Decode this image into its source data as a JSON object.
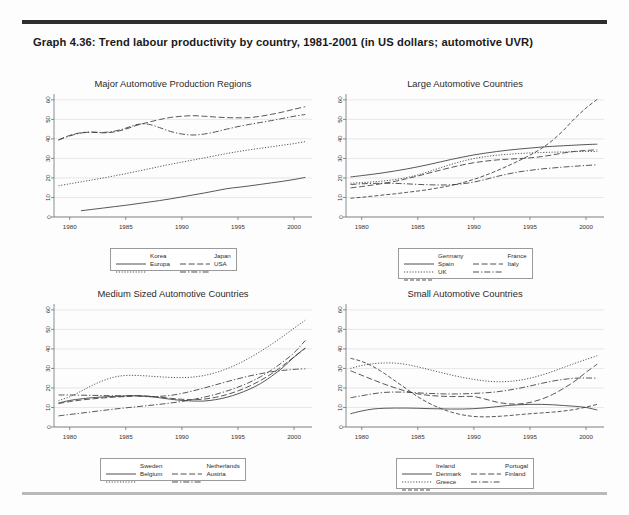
{
  "caption": "Graph 4.36: Trend labour productivity by country, 1981-2001 (in US dollars; automotive UVR)",
  "colors": {
    "line": "#3a3a3a",
    "grid": "#d8d8d8",
    "axis": "#6f6f6f",
    "rule_top": "#2e2e2e",
    "rule_bottom": "#b9b9b9",
    "background": "#fdfdfd"
  },
  "axes": {
    "xticks": [
      "1980",
      "1985",
      "1990",
      "1995",
      "2000"
    ],
    "xtick_values": [
      1980,
      1985,
      1990,
      1995,
      2000
    ],
    "yticks": [
      "0",
      "10",
      "20",
      "30",
      "40",
      "50",
      "60"
    ],
    "ytick_values": [
      0,
      10,
      20,
      30,
      40,
      50,
      60
    ],
    "xlim": [
      1978.6,
      2001.6
    ],
    "ylim": [
      0,
      63
    ],
    "xlabel": "",
    "ylabel": ""
  },
  "chart_data": [
    {
      "id": "major-regions",
      "type": "line",
      "title": "Major Automotive Production Regions",
      "xlabel": "",
      "ylabel": "",
      "xlim": [
        1978.6,
        2001.6
      ],
      "ylim": [
        0,
        63
      ],
      "grid": true,
      "legend_position": "below",
      "x": [
        1979,
        1980,
        1981,
        1982,
        1983,
        1984,
        1985,
        1986,
        1987,
        1988,
        1989,
        1990,
        1991,
        1992,
        1993,
        1994,
        1995,
        1996,
        1997,
        1998,
        1999,
        2000,
        2001
      ],
      "series": [
        {
          "name": "Korea",
          "dash": "solid",
          "values": [
            null,
            null,
            3.2,
            3.9,
            4.6,
            5.3,
            6.0,
            6.8,
            7.6,
            8.4,
            9.3,
            10.3,
            11.3,
            12.3,
            13.4,
            14.5,
            15.2,
            15.9,
            16.7,
            17.5,
            18.3,
            19.2,
            20.3
          ]
        },
        {
          "name": "Japan",
          "dash": "dash",
          "values": [
            39.5,
            41.8,
            43.2,
            43.4,
            43.1,
            43.6,
            45.0,
            47.0,
            48.5,
            49.9,
            51.0,
            51.6,
            51.9,
            51.6,
            51.2,
            50.9,
            50.8,
            50.9,
            51.6,
            52.6,
            53.8,
            55.2,
            56.5
          ]
        },
        {
          "name": "Europa",
          "dash": "dot",
          "values": [
            16.0,
            17.0,
            18.0,
            19.0,
            20.0,
            21.1,
            22.2,
            23.4,
            24.6,
            25.8,
            27.0,
            28.1,
            29.2,
            30.3,
            31.4,
            32.5,
            33.5,
            34.4,
            35.2,
            36.0,
            36.8,
            37.6,
            38.6
          ]
        },
        {
          "name": "USA",
          "dash": "dashdot",
          "values": [
            39.4,
            41.5,
            43.0,
            43.5,
            43.3,
            44.0,
            45.5,
            47.4,
            47.5,
            45.8,
            43.8,
            42.5,
            42.0,
            42.5,
            43.6,
            45.0,
            46.3,
            47.4,
            48.4,
            49.4,
            50.5,
            51.6,
            52.5
          ]
        }
      ]
    },
    {
      "id": "large-countries",
      "type": "line",
      "title": "Large Automotive Countries",
      "xlabel": "",
      "ylabel": "",
      "xlim": [
        1978.6,
        2001.6
      ],
      "ylim": [
        0,
        63
      ],
      "grid": true,
      "legend_position": "below",
      "x": [
        1979,
        1980,
        1981,
        1982,
        1983,
        1984,
        1985,
        1986,
        1987,
        1988,
        1989,
        1990,
        1991,
        1992,
        1993,
        1994,
        1995,
        1996,
        1997,
        1998,
        1999,
        2000,
        2001
      ],
      "series": [
        {
          "name": "Germany",
          "dash": "solid",
          "values": [
            20.5,
            21.2,
            21.9,
            22.7,
            23.6,
            24.6,
            25.7,
            26.9,
            28.2,
            29.5,
            30.7,
            31.8,
            32.7,
            33.5,
            34.2,
            34.8,
            35.3,
            35.8,
            36.2,
            36.5,
            36.8,
            37.1,
            37.3
          ]
        },
        {
          "name": "France",
          "dash": "dash",
          "values": [
            14.9,
            15.6,
            16.4,
            17.3,
            18.3,
            19.6,
            21.0,
            22.5,
            24.0,
            25.4,
            26.7,
            27.8,
            28.6,
            29.2,
            29.6,
            29.9,
            30.3,
            30.9,
            31.8,
            32.8,
            33.6,
            34.1,
            34.4
          ]
        },
        {
          "name": "Spain",
          "dash": "dot",
          "values": [
            17.3,
            17.6,
            18.0,
            18.5,
            19.2,
            20.2,
            21.6,
            23.3,
            25.2,
            27.0,
            28.6,
            29.9,
            30.9,
            31.6,
            32.1,
            32.5,
            32.8,
            33.0,
            33.2,
            33.3,
            33.5,
            33.6,
            33.5
          ]
        },
        {
          "name": "Italy",
          "dash": "dashdot",
          "values": [
            16.6,
            17.0,
            17.2,
            17.3,
            17.2,
            17.0,
            16.7,
            16.5,
            16.4,
            16.5,
            17.0,
            17.9,
            19.2,
            20.7,
            22.0,
            23.1,
            23.9,
            24.6,
            25.1,
            25.6,
            26.0,
            26.4,
            26.7
          ]
        },
        {
          "name": "UK",
          "dash": "longdash",
          "values": [
            9.6,
            10.1,
            10.7,
            11.3,
            11.9,
            12.6,
            13.3,
            14.1,
            15.1,
            16.2,
            17.6,
            19.3,
            21.3,
            23.6,
            26.1,
            28.8,
            31.7,
            35.0,
            39.2,
            44.5,
            50.5,
            55.8,
            60.3
          ]
        }
      ]
    },
    {
      "id": "medium-countries",
      "type": "line",
      "title": "Medium Sized Automotive Countries",
      "xlabel": "",
      "ylabel": "",
      "xlim": [
        1978.6,
        2001.6
      ],
      "ylim": [
        0,
        63
      ],
      "grid": true,
      "legend_position": "below",
      "x": [
        1979,
        1980,
        1981,
        1982,
        1983,
        1984,
        1985,
        1986,
        1987,
        1988,
        1989,
        1990,
        1991,
        1992,
        1993,
        1994,
        1995,
        1996,
        1997,
        1998,
        1999,
        2000,
        2001
      ],
      "series": [
        {
          "name": "Sweden",
          "dash": "solid",
          "values": [
            12.3,
            13.6,
            14.4,
            15.0,
            15.4,
            15.7,
            15.9,
            16.0,
            15.7,
            15.0,
            14.2,
            13.6,
            13.3,
            13.3,
            14.0,
            15.2,
            17.0,
            19.3,
            22.2,
            26.0,
            30.5,
            35.8,
            40.5
          ]
        },
        {
          "name": "Netherlands",
          "dash": "dash",
          "values": [
            12.0,
            13.0,
            13.8,
            14.4,
            14.9,
            15.3,
            15.6,
            15.9,
            15.8,
            15.3,
            14.7,
            14.2,
            14.0,
            14.3,
            15.2,
            16.6,
            18.5,
            20.9,
            23.8,
            27.3,
            31.4,
            35.9,
            40.3
          ]
        },
        {
          "name": "Belgium",
          "dash": "dot",
          "values": [
            13.5,
            15.5,
            18.3,
            21.3,
            23.8,
            25.6,
            26.4,
            26.4,
            26.1,
            25.7,
            25.4,
            25.3,
            25.6,
            26.4,
            27.8,
            29.8,
            32.3,
            35.3,
            38.7,
            42.4,
            46.4,
            50.6,
            54.7
          ]
        },
        {
          "name": "Austria",
          "dash": "dashdot",
          "values": [
            16.4,
            16.4,
            16.3,
            16.2,
            16.1,
            16.0,
            16.0,
            16.0,
            15.5,
            15.7,
            16.2,
            17.2,
            18.5,
            20.0,
            21.6,
            23.2,
            24.7,
            26.1,
            27.3,
            28.3,
            29.0,
            29.5,
            29.8
          ]
        },
        {
          "name": "Austria-lower",
          "dash": "dashdot",
          "values": [
            5.7,
            6.4,
            7.1,
            7.8,
            8.5,
            9.2,
            9.8,
            10.4,
            11.0,
            11.6,
            12.3,
            13.1,
            14.1,
            15.3,
            16.7,
            18.4,
            20.4,
            22.8,
            25.7,
            29.2,
            33.3,
            38.0,
            44.3
          ]
        }
      ]
    },
    {
      "id": "small-countries",
      "type": "line",
      "title": "Small Automotive Countries",
      "xlabel": "",
      "ylabel": "",
      "xlim": [
        1978.6,
        2001.6
      ],
      "ylim": [
        0,
        63
      ],
      "grid": true,
      "legend_position": "below",
      "x": [
        1979,
        1980,
        1981,
        1982,
        1983,
        1984,
        1985,
        1986,
        1987,
        1988,
        1989,
        1990,
        1991,
        1992,
        1993,
        1994,
        1995,
        1996,
        1997,
        1998,
        1999,
        2000,
        2001
      ],
      "series": [
        {
          "name": "Ireland",
          "dash": "solid",
          "values": [
            6.8,
            8.2,
            9.2,
            9.6,
            9.7,
            9.7,
            9.6,
            9.4,
            9.3,
            9.2,
            9.2,
            9.4,
            9.8,
            10.4,
            11.0,
            11.4,
            11.6,
            11.6,
            11.4,
            11.0,
            10.6,
            10.0,
            8.7
          ]
        },
        {
          "name": "Portugal",
          "dash": "dash",
          "values": [
            28.8,
            26.5,
            24.2,
            22.0,
            20.0,
            18.3,
            17.0,
            16.2,
            15.8,
            15.6,
            15.6,
            15.6,
            14.3,
            12.8,
            11.9,
            11.8,
            12.6,
            14.2,
            16.6,
            19.8,
            23.5,
            28.0,
            32.2
          ]
        },
        {
          "name": "Denmark",
          "dash": "dot",
          "values": [
            30.0,
            31.5,
            32.4,
            32.8,
            32.7,
            32.0,
            30.8,
            29.4,
            28.0,
            26.6,
            25.4,
            24.4,
            23.6,
            23.2,
            23.3,
            23.9,
            25.0,
            26.5,
            28.4,
            30.5,
            32.6,
            34.6,
            36.5
          ]
        },
        {
          "name": "Finland",
          "dash": "dashdot",
          "values": [
            15.0,
            16.0,
            17.0,
            17.7,
            17.9,
            17.8,
            17.5,
            17.2,
            17.0,
            16.9,
            17.0,
            17.2,
            17.5,
            18.0,
            18.8,
            19.8,
            21.0,
            22.3,
            23.5,
            24.4,
            25.0,
            25.1,
            25.0
          ]
        },
        {
          "name": "Greece",
          "dash": "longdash",
          "values": [
            35.2,
            33.6,
            31.0,
            27.5,
            23.5,
            19.5,
            15.5,
            12.2,
            9.6,
            7.6,
            6.2,
            5.4,
            5.2,
            5.4,
            5.8,
            6.3,
            6.8,
            7.2,
            7.6,
            8.2,
            9.0,
            10.2,
            11.6
          ]
        }
      ]
    }
  ],
  "legends": [
    {
      "panel": "major-regions",
      "entries": [
        {
          "label": "Korea",
          "dash": "solid"
        },
        {
          "label": "Japan",
          "dash": "dash"
        },
        {
          "label": "Europa",
          "dash": "dot"
        },
        {
          "label": "USA",
          "dash": "dashdot"
        }
      ]
    },
    {
      "panel": "large-countries",
      "entries": [
        {
          "label": "Germany",
          "dash": "solid"
        },
        {
          "label": "France",
          "dash": "dash"
        },
        {
          "label": "Spain",
          "dash": "dot"
        },
        {
          "label": "Italy",
          "dash": "dashdot"
        },
        {
          "label": "UK",
          "dash": "longdash"
        }
      ]
    },
    {
      "panel": "medium-countries",
      "entries": [
        {
          "label": "Sweden",
          "dash": "solid"
        },
        {
          "label": "Netherlands",
          "dash": "dash"
        },
        {
          "label": "Belgium",
          "dash": "dot"
        },
        {
          "label": "Austria",
          "dash": "dashdot"
        }
      ]
    },
    {
      "panel": "small-countries",
      "entries": [
        {
          "label": "Ireland",
          "dash": "solid"
        },
        {
          "label": "Portugal",
          "dash": "dash"
        },
        {
          "label": "Denmark",
          "dash": "dot"
        },
        {
          "label": "Finland",
          "dash": "dashdot"
        },
        {
          "label": "Greece",
          "dash": "longdash"
        }
      ]
    }
  ]
}
